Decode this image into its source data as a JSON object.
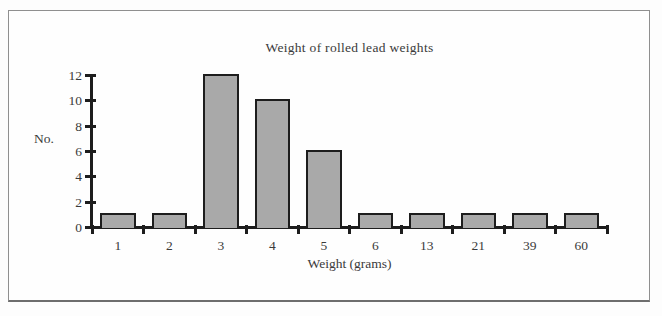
{
  "chart_data": {
    "type": "bar",
    "title": "Weight of rolled lead weights",
    "xlabel": "Weight (grams)",
    "ylabel": "No.",
    "categories": [
      "1",
      "2",
      "3",
      "4",
      "5",
      "6",
      "13",
      "21",
      "39",
      "60"
    ],
    "values": [
      1,
      1,
      12,
      10,
      6,
      1,
      1,
      1,
      1,
      1
    ],
    "y_ticks": [
      0,
      2,
      4,
      6,
      8,
      10,
      12
    ],
    "ylim": [
      0,
      12
    ],
    "grid": false,
    "legend": "none",
    "bar_color": "#a9a9a9",
    "bar_border_color": "#1d1d1d",
    "axis_color": "#1d1d1d",
    "text_color": "#3a3a3a"
  }
}
